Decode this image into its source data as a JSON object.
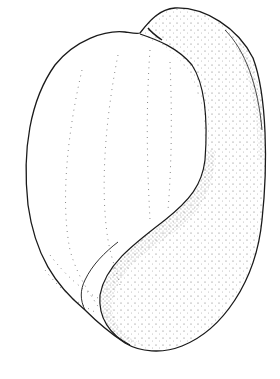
{
  "image": {
    "subject": "stippled line drawing of a shell",
    "background": "#ffffff",
    "ink": "#1a1a1a"
  }
}
